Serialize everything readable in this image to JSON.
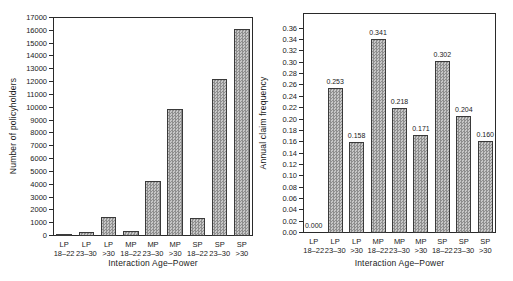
{
  "figure": {
    "background": "#ffffff",
    "axis_color": "#2a2a2a",
    "text_color": "#1a1a1a",
    "bar_fill_dark": "#8e8e8e",
    "bar_fill_light": "#c7c7c7",
    "bar_border": "#3a3a3a"
  },
  "chart_data": [
    {
      "type": "bar",
      "title": "",
      "ylabel": "Number of policyholders",
      "xlabel": "Interaction Age–Power",
      "categories": [
        [
          "LP",
          "18–22"
        ],
        [
          "LP",
          "23–30"
        ],
        [
          "LP",
          ">30"
        ],
        [
          "MP",
          "18–22"
        ],
        [
          "MP",
          "23–30"
        ],
        [
          "MP",
          ">30"
        ],
        [
          "SP",
          "18–22"
        ],
        [
          "SP",
          "23–30"
        ],
        [
          "SP",
          ">30"
        ]
      ],
      "values": [
        50,
        200,
        1400,
        300,
        4200,
        9850,
        1300,
        12150,
        16100
      ],
      "bar_labels": null,
      "ylim": [
        0,
        17000
      ],
      "ytick_step": 1000,
      "yticks": [
        "0",
        "1000",
        "2000",
        "3000",
        "4000",
        "5000",
        "6000",
        "7000",
        "8000",
        "9000",
        "10000",
        "11000",
        "12000",
        "13000",
        "14000",
        "15000",
        "16000",
        "17000"
      ],
      "grid": false,
      "legend": null
    },
    {
      "type": "bar",
      "title": "",
      "ylabel": "Annual claim frequency",
      "xlabel": "Interaction Age–Power",
      "categories": [
        [
          "LP",
          "18–22"
        ],
        [
          "LP",
          "23–30"
        ],
        [
          "LP",
          ">30"
        ],
        [
          "MP",
          "18–22"
        ],
        [
          "MP",
          "23–30"
        ],
        [
          "MP",
          ">30"
        ],
        [
          "SP",
          "18–22"
        ],
        [
          "SP",
          "23–30"
        ],
        [
          "SP",
          ">30"
        ]
      ],
      "values": [
        0.0,
        0.253,
        0.158,
        0.341,
        0.218,
        0.171,
        0.302,
        0.204,
        0.16
      ],
      "bar_labels": [
        "0.000",
        "0.253",
        "0.158",
        "0.341",
        "0.218",
        "0.171",
        "0.302",
        "0.204",
        "0.160"
      ],
      "ylim": [
        0,
        0.36
      ],
      "ytick_step": 0.02,
      "yticks": [
        "0.00",
        "0.02",
        "0.04",
        "0.06",
        "0.08",
        "0.10",
        "0.12",
        "0.14",
        "0.16",
        "0.18",
        "0.20",
        "0.22",
        "0.24",
        "0.26",
        "0.28",
        "0.30",
        "0.32",
        "0.34",
        "0.36"
      ],
      "grid": false,
      "legend": null
    }
  ]
}
